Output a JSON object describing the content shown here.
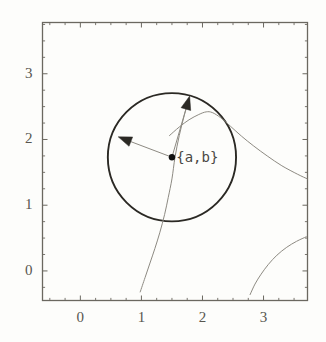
{
  "figure": {
    "title": "",
    "background_color": "#fdfdfb",
    "frame_color": "#6b6860",
    "annotation": {
      "point_label": "{a,b}",
      "point_label_x": 1.57,
      "point_label_y": 1.72
    }
  },
  "chart_data": {
    "type": "line",
    "title": "",
    "xlabel": "",
    "ylabel": "",
    "xlim": [
      -0.62,
      3.72
    ],
    "ylim": [
      -0.45,
      3.78
    ],
    "grid": false,
    "legend": null,
    "xticks": [
      0,
      1,
      2,
      3
    ],
    "xtick_labels": [
      "0",
      "1",
      "2",
      "3"
    ],
    "yticks": [
      0,
      1,
      2,
      3
    ],
    "ytick_labels": [
      "0",
      "1",
      "2",
      "3"
    ],
    "xminor_ticks": [
      -0.5,
      -0.25,
      0.25,
      0.5,
      0.75,
      1.25,
      1.5,
      1.75,
      2.25,
      2.5,
      2.75,
      3.25,
      3.5
    ],
    "yminor_ticks": [
      -0.25,
      0.25,
      0.5,
      0.75,
      1.25,
      1.5,
      1.75,
      2.25,
      2.5,
      2.75,
      3.25,
      3.5,
      3.75
    ],
    "series": [
      {
        "name": "circle",
        "type": "circle",
        "center": [
          1.5,
          1.73
        ],
        "radius": 1.05,
        "color": "#2b2924",
        "width": 1.9
      },
      {
        "name": "contour-upper",
        "type": "line",
        "color": "#8d8a82",
        "width": 1.0,
        "points": [
          [
            1.46,
            2.06
          ],
          [
            1.62,
            2.19
          ],
          [
            1.78,
            2.3
          ],
          [
            1.94,
            2.38
          ],
          [
            2.06,
            2.42
          ],
          [
            2.16,
            2.41
          ],
          [
            2.3,
            2.33
          ],
          [
            2.46,
            2.2
          ],
          [
            2.64,
            2.05
          ],
          [
            2.84,
            1.9
          ],
          [
            3.06,
            1.75
          ],
          [
            3.3,
            1.6
          ],
          [
            3.56,
            1.47
          ],
          [
            3.72,
            1.4
          ]
        ]
      },
      {
        "name": "contour-lower-right",
        "type": "line",
        "color": "#8d8a82",
        "width": 1.0,
        "points": [
          [
            2.78,
            -0.36
          ],
          [
            2.86,
            -0.2
          ],
          [
            2.96,
            -0.05
          ],
          [
            3.08,
            0.1
          ],
          [
            3.22,
            0.24
          ],
          [
            3.38,
            0.36
          ],
          [
            3.54,
            0.45
          ],
          [
            3.7,
            0.52
          ]
        ]
      },
      {
        "name": "gradient-line",
        "type": "line",
        "color": "#8d8a82",
        "width": 1.0,
        "points": [
          [
            0.98,
            -0.32
          ],
          [
            1.06,
            -0.1
          ],
          [
            1.14,
            0.12
          ],
          [
            1.22,
            0.34
          ],
          [
            1.3,
            0.58
          ],
          [
            1.38,
            0.86
          ],
          [
            1.44,
            1.12
          ],
          [
            1.5,
            1.4
          ],
          [
            1.55,
            1.73
          ],
          [
            1.62,
            2.06
          ],
          [
            1.7,
            2.36
          ],
          [
            1.78,
            2.62
          ]
        ]
      }
    ],
    "arrows": [
      {
        "name": "gradient-arrow",
        "from": [
          1.5,
          1.73
        ],
        "to": [
          1.79,
          2.66
        ],
        "color": "#2b2924"
      },
      {
        "name": "tangent-arrow",
        "from": [
          1.5,
          1.73
        ],
        "to": [
          0.62,
          2.04
        ],
        "color": "#2b2924"
      }
    ],
    "points": [
      {
        "name": "center-point",
        "x": 1.5,
        "y": 1.73,
        "color": "#111111",
        "size": 3.2
      }
    ]
  }
}
